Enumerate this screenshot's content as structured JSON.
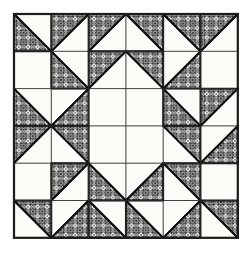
{
  "figure": {
    "kind": "quilt-block-line-drawing",
    "medium": "scanned line drawing on paper"
  },
  "canvas": {
    "width": 252,
    "height": 258,
    "background_color": "#ffffff"
  },
  "block": {
    "name": "Half-square triangle medallion quilt block",
    "grid_rows": 6,
    "grid_cols": 6,
    "origin_x": 14,
    "origin_y": 14,
    "cell_size": 37.3,
    "outer_border_color": "#1a1a1a",
    "outer_border_width": 2.2,
    "grid_line_color": "#2a2a2a",
    "grid_line_width": 0.9,
    "patch_outline_color": "#111111",
    "patch_outline_width": 1.9,
    "background_patch_color": "#fbfbf7",
    "paper_tint": "#f7f6f1"
  },
  "fabric_texture": {
    "name": "printed-fabric-hatch",
    "description": "grid of outlined circles overlaid with an orthogonal and diagonal line lattice",
    "tile_size": 9.4,
    "line_color": "#101010",
    "circle_stroke_color": "#101010",
    "fill_color": "#ffffff",
    "line_width": 0.85,
    "circle_radius": 3.0
  },
  "legend": {
    "patterned_label": "patterned fabric",
    "plain_label": "plain fabric"
  },
  "chart_data": {
    "type": "heatmap",
    "xlabel": "column",
    "ylabel": "row",
    "categories": [
      "1",
      "2",
      "3",
      "4",
      "5",
      "6"
    ],
    "rows": [
      "1",
      "2",
      "3",
      "4",
      "5",
      "6"
    ],
    "legend_position": "none",
    "grid": true,
    "value_encoding": {
      "0": "plain square (no patterned triangle)",
      "1": "patterned triangle in upper-left half (diagonal from bottom-left to top-right)",
      "2": "patterned triangle in upper-right half (diagonal from top-left to bottom-right)",
      "3": "patterned triangle in lower-right half (diagonal from bottom-left to top-right)",
      "4": "patterned triangle in lower-left half (diagonal from top-left to bottom-right)",
      "5": "fully patterned square"
    },
    "values": [
      [
        4,
        1,
        1,
        2,
        2,
        1
      ],
      [
        0,
        4,
        1,
        2,
        3,
        0
      ],
      [
        4,
        3,
        0,
        0,
        4,
        1
      ],
      [
        1,
        2,
        0,
        0,
        2,
        3
      ],
      [
        0,
        1,
        4,
        3,
        2,
        0
      ],
      [
        2,
        3,
        4,
        4,
        3,
        2
      ]
    ]
  }
}
